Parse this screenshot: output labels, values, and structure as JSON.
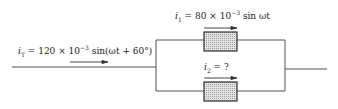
{
  "labels": {
    "total_current": {
      "var": "i",
      "sub": "T",
      "text": " = 120 × 10",
      "exp": "−3",
      "tail": " sin(ωt + 60°)"
    },
    "branch1_current": {
      "var": "i",
      "sub": "1",
      "text": " = 80 × 10",
      "exp": "−3",
      "tail": " sin ωt"
    },
    "branch2_current": {
      "var": "i",
      "sub": "2",
      "text": " = ?"
    }
  },
  "colors": {
    "wire": "#555555",
    "box_fill": "#d9d9d9",
    "box_stroke": "#333333"
  }
}
